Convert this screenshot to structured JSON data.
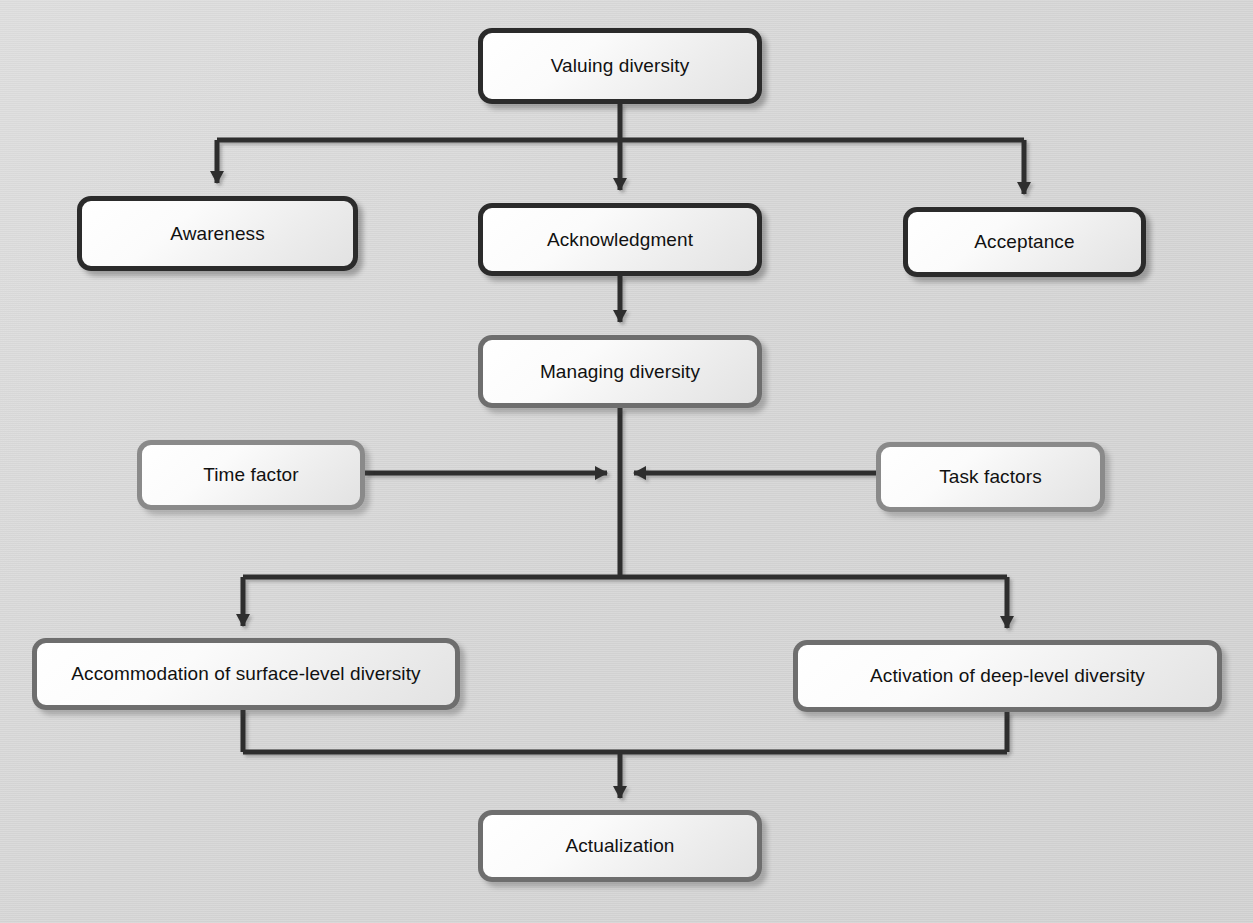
{
  "diagram": {
    "background_color": "#d8d8d8",
    "edge_color_dark": "#2b2b2b",
    "edge_color_mid": "#4a4a4a",
    "nodes": [
      {
        "id": "valuing-diversity",
        "label": "Valuing diversity",
        "x": 478,
        "y": 28,
        "w": 284,
        "h": 76,
        "style": "dark"
      },
      {
        "id": "awareness",
        "label": "Awareness",
        "x": 77,
        "y": 196,
        "w": 281,
        "h": 75,
        "style": "dark"
      },
      {
        "id": "acknowledgment",
        "label": "Acknowledgment",
        "x": 478,
        "y": 203,
        "w": 284,
        "h": 73,
        "style": "dark"
      },
      {
        "id": "acceptance",
        "label": "Acceptance",
        "x": 903,
        "y": 207,
        "w": 243,
        "h": 70,
        "style": "dark"
      },
      {
        "id": "managing-diversity",
        "label": "Managing diversity",
        "x": 478,
        "y": 335,
        "w": 284,
        "h": 73,
        "style": "mid"
      },
      {
        "id": "time-factor",
        "label": "Time factor",
        "x": 137,
        "y": 440,
        "w": 228,
        "h": 70,
        "style": "gray"
      },
      {
        "id": "task-factors",
        "label": "Task factors",
        "x": 876,
        "y": 442,
        "w": 229,
        "h": 70,
        "style": "gray"
      },
      {
        "id": "accommodation-surface-level",
        "label": "Accommodation of surface-level diversity",
        "x": 32,
        "y": 638,
        "w": 428,
        "h": 72,
        "style": "mid"
      },
      {
        "id": "activation-deep-level",
        "label": "Activation of deep-level diversity",
        "x": 793,
        "y": 640,
        "w": 429,
        "h": 72,
        "style": "mid"
      },
      {
        "id": "actualization",
        "label": "Actualization",
        "x": 478,
        "y": 810,
        "w": 284,
        "h": 72,
        "style": "mid"
      }
    ],
    "edges": [
      {
        "id": "edge-valuing-to-awareness",
        "from": "valuing-diversity",
        "to": "awareness",
        "kind": "split-down"
      },
      {
        "id": "edge-valuing-to-acknowledgment",
        "from": "valuing-diversity",
        "to": "acknowledgment",
        "kind": "straight-down"
      },
      {
        "id": "edge-valuing-to-acceptance",
        "from": "valuing-diversity",
        "to": "acceptance",
        "kind": "split-down"
      },
      {
        "id": "edge-acknowledgment-to-managing",
        "from": "acknowledgment",
        "to": "managing-diversity",
        "kind": "straight-down"
      },
      {
        "id": "edge-managing-to-junction",
        "from": "managing-diversity",
        "to": "junction",
        "kind": "straight-down"
      },
      {
        "id": "edge-time-factor-to-junction",
        "from": "time-factor",
        "to": "junction",
        "kind": "straight-right"
      },
      {
        "id": "edge-task-factors-to-junction",
        "from": "task-factors",
        "to": "junction",
        "kind": "straight-left"
      },
      {
        "id": "edge-junction-to-accommodation",
        "from": "junction",
        "to": "accommodation-surface-level",
        "kind": "split-down"
      },
      {
        "id": "edge-junction-to-activation",
        "from": "junction",
        "to": "activation-deep-level",
        "kind": "split-down"
      },
      {
        "id": "edge-accommodation-to-actualization",
        "from": "accommodation-surface-level",
        "to": "actualization",
        "kind": "merge-down"
      },
      {
        "id": "edge-activation-to-actualization",
        "from": "activation-deep-level",
        "to": "actualization",
        "kind": "merge-down"
      }
    ]
  }
}
